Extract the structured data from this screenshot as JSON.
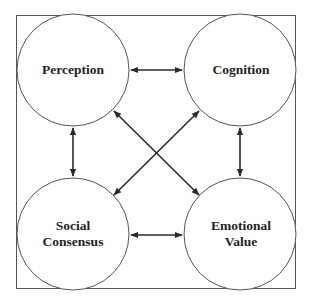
{
  "diagram": {
    "type": "concept-relationship",
    "frame": {
      "x": 16,
      "y": 15,
      "width": 279,
      "height": 273,
      "stroke": "#555555"
    },
    "colors": {
      "circle_stroke": "#555555",
      "arrow": "#2a2a2a",
      "text": "#1f1f1f",
      "background": "#ffffff"
    },
    "nodes": [
      {
        "id": "perception",
        "lines": [
          "Perception"
        ],
        "cx": 73,
        "cy": 70,
        "r": 56
      },
      {
        "id": "cognition",
        "lines": [
          "Cognition"
        ],
        "cx": 240,
        "cy": 70,
        "r": 56
      },
      {
        "id": "social-consensus",
        "lines": [
          "Social",
          "Consensus"
        ],
        "cx": 73,
        "cy": 234,
        "r": 56
      },
      {
        "id": "emotional-value",
        "lines": [
          "Emotional",
          "Value"
        ],
        "cx": 240,
        "cy": 234,
        "r": 56
      }
    ],
    "edges": [
      {
        "from": "perception",
        "to": "cognition",
        "direction": "bidirectional"
      },
      {
        "from": "perception",
        "to": "social-consensus",
        "direction": "bidirectional"
      },
      {
        "from": "cognition",
        "to": "emotional-value",
        "direction": "bidirectional"
      },
      {
        "from": "social-consensus",
        "to": "emotional-value",
        "direction": "bidirectional"
      },
      {
        "from": "perception",
        "to": "emotional-value",
        "direction": "bidirectional"
      },
      {
        "from": "cognition",
        "to": "social-consensus",
        "direction": "bidirectional"
      }
    ]
  }
}
